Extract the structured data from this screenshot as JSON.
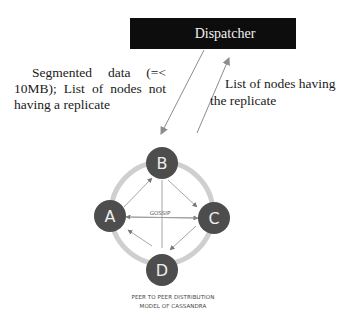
{
  "dispatcher": {
    "label": "Dispatcher"
  },
  "left_annotation": {
    "line1": "Segmented data (=<",
    "line2": "10MB); List of nodes not",
    "line3": "having a replicate"
  },
  "right_annotation": {
    "line1": "List of nodes having",
    "line2": "the replicate"
  },
  "nodes": [
    {
      "id": "A",
      "label": "A"
    },
    {
      "id": "B",
      "label": "B"
    },
    {
      "id": "C",
      "label": "C"
    },
    {
      "id": "D",
      "label": "D"
    }
  ],
  "center_label": "GOSSIP",
  "caption": {
    "line1": "PEER TO PEER DISTRIBUTION",
    "line2": "MODEL OF CASSANDRA"
  },
  "colors": {
    "dispatcher_bg": "#0d0d0d",
    "node_fill": "#4d4d4d",
    "ring": "#c8c8c8",
    "arrow": "#8c8c8c"
  }
}
